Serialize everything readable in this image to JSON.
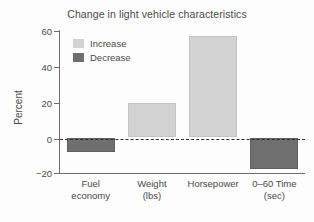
{
  "chart_data": {
    "type": "bar",
    "title": "Change in light vehicle characteristics",
    "xlabel": "",
    "ylabel": "Percent",
    "categories": [
      "Fuel economy",
      "Weight (lbs)",
      "Horsepower",
      "0–60 Time (sec)"
    ],
    "category_lines": [
      {
        "line1": "Fuel",
        "line2": "economy"
      },
      {
        "line1": "Weight",
        "line2": "(lbs)"
      },
      {
        "line1": "Horsepower",
        "line2": ""
      },
      {
        "line1": "0–60 Time",
        "line2": "(sec)"
      }
    ],
    "values": [
      -8,
      19.5,
      57,
      -18
    ],
    "ylim": [
      -20,
      60
    ],
    "yticks": [
      60,
      40,
      20,
      0,
      -20
    ],
    "ytick_labels": [
      "60",
      "40",
      "20",
      "0",
      "−20"
    ],
    "grid": false,
    "zero_line": true,
    "legend_position": "upper-left-inside",
    "legend": [
      {
        "label": "Increase",
        "color": "#d2d2d2"
      },
      {
        "label": "Decrease",
        "color": "#6f6f6f"
      }
    ],
    "bars": [
      {
        "category": "Fuel economy",
        "value": -8,
        "series": "Decrease",
        "color": "#6f6f6f"
      },
      {
        "category": "Weight (lbs)",
        "value": 19.5,
        "series": "Increase",
        "color": "#d2d2d2"
      },
      {
        "category": "Horsepower",
        "value": 57,
        "series": "Increase",
        "color": "#d2d2d2"
      },
      {
        "category": "0–60 Time (sec)",
        "value": -18,
        "series": "Decrease",
        "color": "#6f6f6f"
      }
    ]
  }
}
